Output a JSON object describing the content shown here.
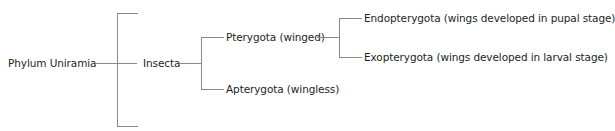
{
  "diagram": {
    "type": "classification-tree",
    "root": {
      "label": "Phylum Uniramia",
      "children": [
        {
          "label": "Insecta",
          "children": [
            {
              "label": "Pterygota (winged)",
              "children": [
                {
                  "label": "Endopterygota (wings developed in pupal stage)"
                },
                {
                  "label": "Exopterygota (wings developed in larval stage)"
                }
              ]
            },
            {
              "label": "Apterygota (wingless)"
            }
          ]
        }
      ]
    },
    "line_color": "#8a8a8a",
    "text_color": "#231f20"
  }
}
